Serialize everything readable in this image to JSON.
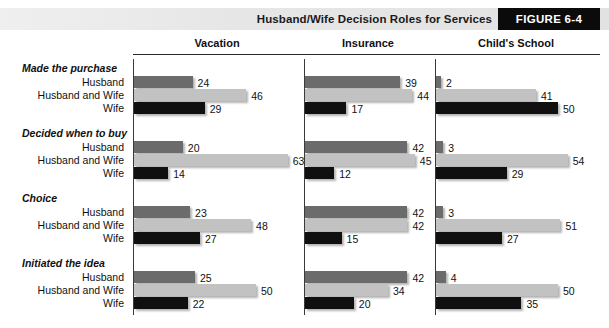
{
  "header": {
    "title": "Husband/Wife Decision Roles for Services",
    "figure_label": "FIGURE 6-4"
  },
  "chart_data": {
    "type": "bar",
    "title": "Husband/Wife Decision Roles for Services",
    "orientation": "horizontal",
    "xlabel": "",
    "ylabel": "",
    "xlim": [
      0,
      70
    ],
    "grid": false,
    "legend_position": "none",
    "panels": [
      "Vacation",
      "Insurance",
      "Child's School"
    ],
    "groups": [
      "Made the purchase",
      "Decided when to buy",
      "Choice",
      "Initiated the idea"
    ],
    "categories": [
      "Husband",
      "Husband and Wife",
      "Wife"
    ],
    "series": [
      {
        "name": "Vacation",
        "groups": [
          {
            "group": "Made the purchase",
            "values": [
              24,
              46,
              29
            ]
          },
          {
            "group": "Decided when to buy",
            "values": [
              20,
              63,
              14
            ]
          },
          {
            "group": "Choice",
            "values": [
              23,
              48,
              27
            ]
          },
          {
            "group": "Initiated the idea",
            "values": [
              25,
              50,
              22
            ]
          }
        ]
      },
      {
        "name": "Insurance",
        "groups": [
          {
            "group": "Made the purchase",
            "values": [
              39,
              44,
              17
            ]
          },
          {
            "group": "Decided when to buy",
            "values": [
              42,
              45,
              12
            ]
          },
          {
            "group": "Choice",
            "values": [
              42,
              42,
              15
            ]
          },
          {
            "group": "Initiated the idea",
            "values": [
              42,
              34,
              20
            ]
          }
        ]
      },
      {
        "name": "Child's School",
        "groups": [
          {
            "group": "Made the purchase",
            "values": [
              2,
              41,
              50
            ]
          },
          {
            "group": "Decided when to buy",
            "values": [
              3,
              54,
              29
            ]
          },
          {
            "group": "Choice",
            "values": [
              3,
              51,
              27
            ]
          },
          {
            "group": "Initiated the idea",
            "values": [
              4,
              50,
              35
            ]
          }
        ]
      }
    ],
    "colors": {
      "husband": "#6b6b6b",
      "husband_and_wife": "#c2c2c2",
      "wife": "#101010"
    }
  }
}
